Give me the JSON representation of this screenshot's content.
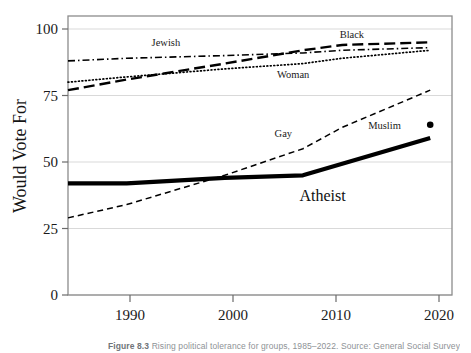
{
  "figure": {
    "caption_label": "Figure 8.3",
    "caption_text": "Rising political tolerance for groups, 1985–2022. Source: General Social Survey."
  },
  "axes": {
    "y_title": "Would Vote For",
    "y_ticks": [
      "0",
      "25",
      "50",
      "75",
      "100"
    ],
    "x_ticks": [
      "1990",
      "2000",
      "2010",
      "2020"
    ]
  },
  "labels": {
    "jewish": "Jewish",
    "black": "Black",
    "woman": "Woman",
    "gay": "Gay",
    "atheist": "Atheist",
    "muslim": "Muslim"
  },
  "colors": {
    "line": "#000000",
    "grid": "#d9d9d9",
    "frame": "#8c8c8c",
    "text": "#1a1a1a"
  },
  "chart_data": {
    "type": "line",
    "title": "",
    "xlabel": "",
    "ylabel": "Would Vote For",
    "xlim": [
      1984,
      2022
    ],
    "ylim": [
      0,
      100
    ],
    "grid": true,
    "legend_position": "inline-labels",
    "x_ticks": [
      1990,
      2000,
      2010,
      2020
    ],
    "y_ticks": [
      0,
      25,
      50,
      75,
      100
    ],
    "series": [
      {
        "name": "Jewish",
        "style": "dash-dot",
        "x": [
          1984,
          1990,
          2000,
          2008,
          2012,
          2021
        ],
        "values": [
          88,
          89,
          90,
          91,
          92,
          93
        ]
      },
      {
        "name": "Black",
        "style": "long-dash",
        "x": [
          1984,
          1990,
          2000,
          2008,
          2012,
          2021
        ],
        "values": [
          77,
          81,
          87,
          92,
          94,
          95
        ]
      },
      {
        "name": "Woman",
        "style": "dotted",
        "x": [
          1984,
          1990,
          2000,
          2008,
          2012,
          2021
        ],
        "values": [
          80,
          82,
          85,
          87,
          89,
          92
        ]
      },
      {
        "name": "Gay",
        "style": "dashed",
        "x": [
          1984,
          1990,
          2000,
          2008,
          2012,
          2021
        ],
        "values": [
          29,
          34,
          45,
          55,
          63,
          77
        ]
      },
      {
        "name": "Atheist",
        "style": "thick-solid",
        "x": [
          1984,
          1990,
          2000,
          2008,
          2021
        ],
        "values": [
          42,
          42,
          44,
          45,
          59
        ]
      },
      {
        "name": "Muslim",
        "style": "point",
        "x": [
          2021
        ],
        "values": [
          64
        ]
      }
    ],
    "annotations": [
      {
        "text": "Jewish",
        "x": 1994,
        "y": 95
      },
      {
        "text": "Black",
        "x": 2013,
        "y": 98
      },
      {
        "text": "Woman",
        "x": 2007,
        "y": 83
      },
      {
        "text": "Gay",
        "x": 2006,
        "y": 61
      },
      {
        "text": "Atheist",
        "x": 2010,
        "y": 37
      },
      {
        "text": "Muslim",
        "x": 2018,
        "y": 64
      }
    ]
  }
}
